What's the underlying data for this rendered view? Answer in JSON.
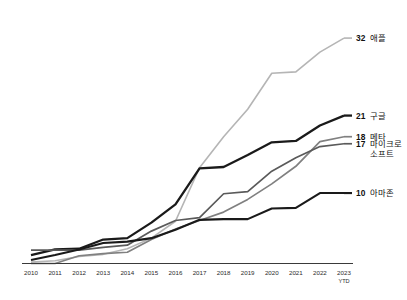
{
  "chart_data": {
    "type": "line",
    "title": "",
    "subtitle": "",
    "xlabel": "",
    "ylabel": "",
    "grid": false,
    "legend_position": "right-inline-end-labels",
    "categories": [
      "2010",
      "2011",
      "2012",
      "2013",
      "2014",
      "2015",
      "2016",
      "2017",
      "2018",
      "2019",
      "2020",
      "2021",
      "2022",
      "2023"
    ],
    "x_tick_sub": {
      "2023": "YTD"
    },
    "ylim": [
      0,
      34
    ],
    "series": [
      {
        "name": "애플",
        "end_value": 32,
        "color": "#b5b5b5",
        "width": 1.6,
        "values": [
          0.2,
          0.4,
          1.0,
          1.3,
          2.1,
          3.6,
          6.0,
          13.6,
          18.0,
          21.9,
          27.0,
          27.2,
          30.0,
          32.0
        ]
      },
      {
        "name": "구글",
        "end_value": 21,
        "color": "#1a1a1a",
        "width": 2.3,
        "values": [
          1.2,
          2.0,
          2.1,
          3.4,
          3.6,
          5.8,
          8.4,
          13.5,
          13.7,
          15.4,
          17.2,
          17.4,
          19.6,
          21.0
        ]
      },
      {
        "name": "메타",
        "end_value": 18,
        "color": "#808080",
        "width": 1.7,
        "values": [
          0.0,
          0.0,
          1.1,
          1.4,
          1.6,
          3.4,
          4.9,
          6.1,
          7.3,
          9.1,
          11.3,
          13.8,
          17.3,
          18.0
        ]
      },
      {
        "name": "마이크로 소프트",
        "end_value": 17,
        "color": "#5a5a5a",
        "width": 1.7,
        "values": [
          1.9,
          1.9,
          1.9,
          2.3,
          2.6,
          4.6,
          6.1,
          6.5,
          9.9,
          10.2,
          13.1,
          15.0,
          16.6,
          17.0
        ]
      },
      {
        "name": "아마존",
        "end_value": 10,
        "color": "#1a1a1a",
        "width": 2.1,
        "values": [
          0.5,
          1.2,
          2.0,
          2.9,
          3.1,
          3.6,
          4.8,
          6.2,
          6.3,
          6.3,
          7.8,
          7.9,
          10.0,
          10.0
        ]
      }
    ],
    "end_labels": [
      {
        "value": "32",
        "name": "애플",
        "name2": ""
      },
      {
        "value": "21",
        "name": "구글",
        "name2": ""
      },
      {
        "value": "18",
        "name": "메타",
        "name2": ""
      },
      {
        "value": "17",
        "name": "마이크로",
        "name2": "소프트"
      },
      {
        "value": "10",
        "name": "아마존",
        "name2": ""
      }
    ],
    "axis_color": "#3a3a3a"
  }
}
